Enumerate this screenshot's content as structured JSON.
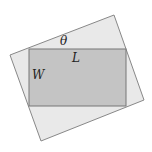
{
  "diagram": {
    "labels": {
      "theta": "θ",
      "length": "L",
      "width": "W"
    },
    "colors": {
      "outer_fill": "#e9e9e9",
      "inner_fill": "#c4c4c4",
      "stroke": "#777777"
    }
  }
}
